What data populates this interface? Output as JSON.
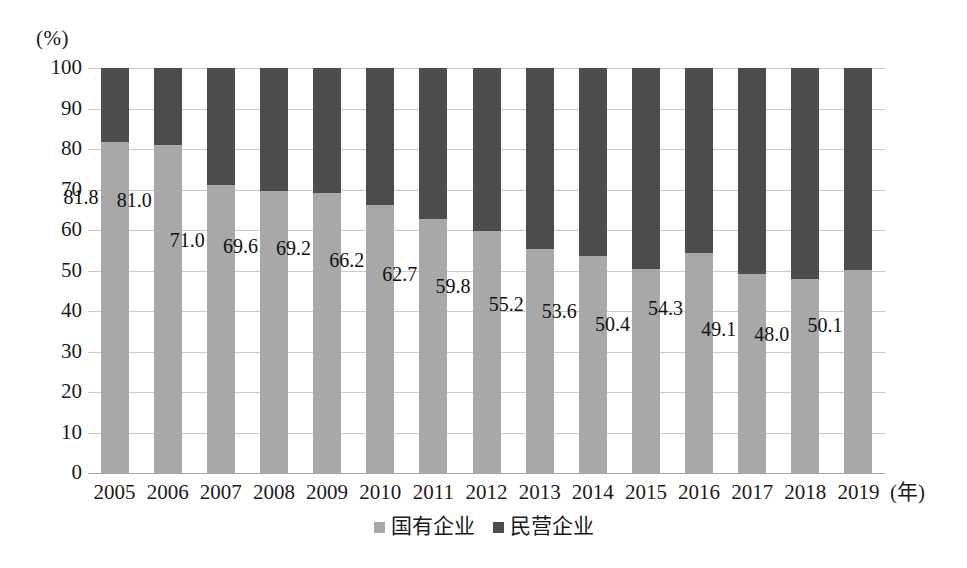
{
  "chart_data": {
    "type": "bar",
    "subtype": "stacked-100-percent",
    "title": "",
    "xlabel": "(年)",
    "ylabel": "(%)",
    "ylim": [
      0,
      100
    ],
    "ytick_step": 10,
    "grid": true,
    "legend_position": "bottom-center",
    "categories": [
      "2005",
      "2006",
      "2007",
      "2008",
      "2009",
      "2010",
      "2011",
      "2012",
      "2013",
      "2014",
      "2015",
      "2016",
      "2017",
      "2018",
      "2019"
    ],
    "ytick_labels": [
      "100",
      "90",
      "80",
      "70",
      "60",
      "50",
      "40",
      "30",
      "20",
      "10",
      "0"
    ],
    "ytick_values": [
      100,
      90,
      80,
      70,
      60,
      50,
      40,
      30,
      20,
      10,
      0
    ],
    "series": [
      {
        "name": "国有企业",
        "color": "#a8a8a8",
        "values": [
          81.8,
          81.0,
          71.0,
          69.6,
          69.2,
          66.2,
          62.7,
          59.8,
          55.2,
          53.6,
          50.4,
          54.3,
          49.1,
          48.0,
          50.1
        ],
        "labels": [
          "81.8",
          "81.0",
          "71.0",
          "69.6",
          "69.2",
          "66.2",
          "62.7",
          "59.8",
          "55.2",
          "53.6",
          "50.4",
          "54.3",
          "49.1",
          "48.0",
          "50.1"
        ],
        "labels_shown": true
      },
      {
        "name": "民营企业",
        "color": "#4d4d4d",
        "values": [
          18.2,
          19.0,
          29.0,
          30.4,
          30.8,
          33.8,
          37.3,
          40.2,
          44.8,
          46.4,
          49.6,
          45.7,
          50.9,
          52.0,
          49.9
        ],
        "labels_shown": false
      }
    ],
    "data_label_rows": [
      {
        "year": "2005",
        "国有企业": 81.8,
        "民营企业": 18.2
      },
      {
        "year": "2006",
        "国有企业": 81.0,
        "民营企业": 19.0
      },
      {
        "year": "2007",
        "国有企业": 71.0,
        "民营企业": 29.0
      },
      {
        "year": "2008",
        "国有企业": 69.6,
        "民营企业": 30.4
      },
      {
        "year": "2009",
        "国有企业": 69.2,
        "民营企业": 30.8
      },
      {
        "year": "2010",
        "国有企业": 66.2,
        "民营企业": 33.8
      },
      {
        "year": "2011",
        "国有企业": 62.7,
        "民营企业": 37.3
      },
      {
        "year": "2012",
        "国有企业": 59.8,
        "民营企业": 40.2
      },
      {
        "year": "2013",
        "国有企业": 55.2,
        "民营企业": 44.8
      },
      {
        "year": "2014",
        "国有企业": 53.6,
        "民营企业": 46.4
      },
      {
        "year": "2015",
        "国有企业": 50.4,
        "民营企业": 49.6
      },
      {
        "year": "2016",
        "国有企业": 54.3,
        "民营企业": 45.7
      },
      {
        "year": "2017",
        "国有企业": 49.1,
        "民营企业": 50.9
      },
      {
        "year": "2018",
        "国有企业": 48.0,
        "民营企业": 52.0
      },
      {
        "year": "2019",
        "国有企业": 50.1,
        "民营企业": 49.9
      }
    ]
  },
  "colors": {
    "state_owned": "#a8a8a8",
    "private": "#4d4d4d",
    "gridline": "#c9c9c9",
    "baseline": "#a5a5a5",
    "text": "#111111",
    "background": "#ffffff"
  }
}
